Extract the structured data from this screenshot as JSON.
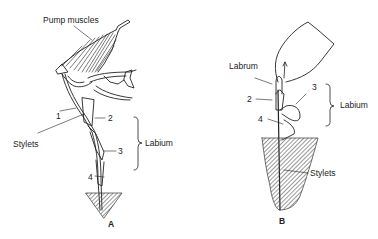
{
  "figure": {
    "panels": [
      {
        "id": "A",
        "label": "A",
        "labels": {
          "pump_muscles": "Pump muscles",
          "stylets": "Stylets",
          "labium": "Labium",
          "n1": "1",
          "n2": "2",
          "n3": "3",
          "n4": "4"
        }
      },
      {
        "id": "B",
        "label": "B",
        "labels": {
          "labrum": "Labrum",
          "stylets": "Stylets",
          "labium": "Labium",
          "n2": "2",
          "n3": "3",
          "n4": "4"
        }
      }
    ]
  },
  "colors": {
    "ink": "#222222",
    "hatch": "#555555",
    "background": "#ffffff"
  }
}
